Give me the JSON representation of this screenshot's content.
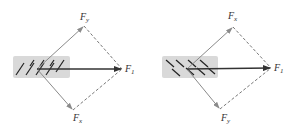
{
  "diagrams": [
    {
      "id": "left",
      "labels": {
        "top": {
          "main": "F",
          "sub": "y"
        },
        "right": {
          "main": "F",
          "sub": "1"
        },
        "bottom": {
          "main": "F",
          "sub": "x"
        }
      }
    },
    {
      "id": "right",
      "labels": {
        "top": {
          "main": "F",
          "sub": "x"
        },
        "right": {
          "main": "F",
          "sub": "1"
        },
        "bottom": {
          "main": "F",
          "sub": "y"
        }
      }
    }
  ],
  "colors": {
    "box": "#d9d9d9",
    "resultant": "#333333",
    "component": "#8a8a8a",
    "dashed": "#555555",
    "hatch": "#222222"
  }
}
